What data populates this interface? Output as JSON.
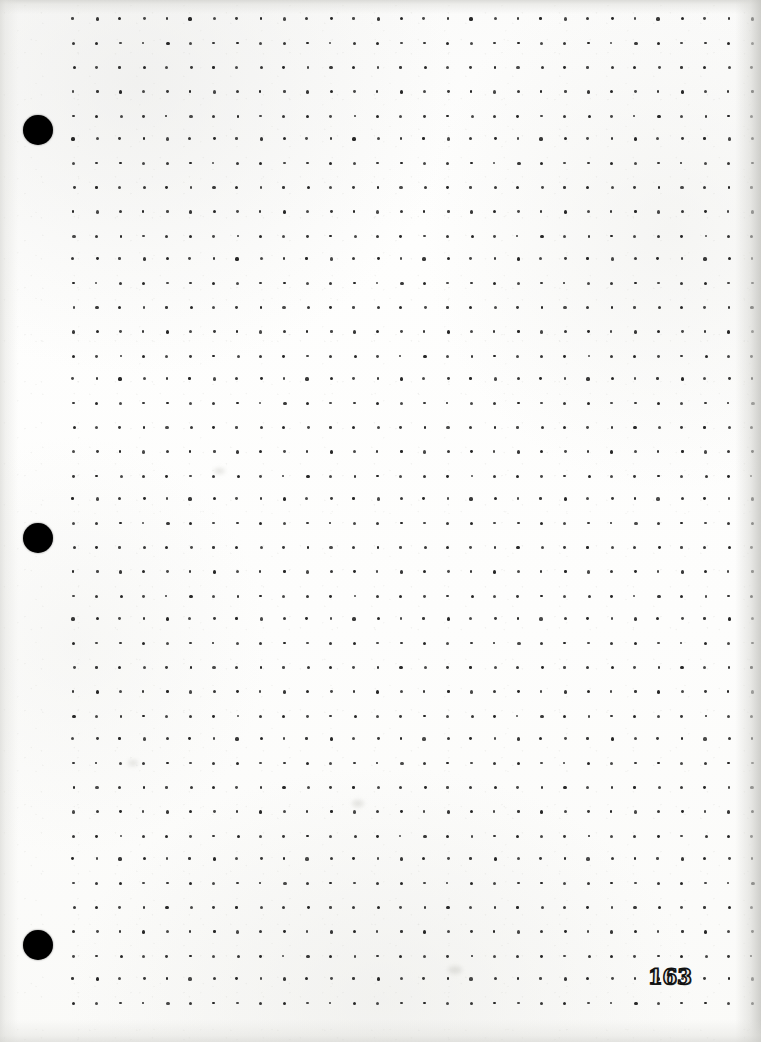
{
  "document": {
    "kind": "scanned-notebook-page",
    "description": "Blank dot-grid notebook page, three-hole punched, scanned",
    "page_number": "163",
    "paper_color": "#fdfdfc",
    "dot_color": "#1b1b1b",
    "hole_color": "#000000",
    "page_width": 761,
    "page_height": 1042
  },
  "grid": {
    "label": "dot-grid",
    "dot_diameter_px": 3,
    "spacing_x_px": 23.4,
    "spacing_y_px": 24.0,
    "origin_x_px": 72,
    "origin_y_px": 18,
    "columns": 30,
    "rows": 42
  },
  "holes": [
    {
      "label": "hole-punch-top",
      "cx": 38,
      "cy": 130,
      "r": 15
    },
    {
      "label": "hole-punch-middle",
      "cx": 38,
      "cy": 538,
      "r": 15
    },
    {
      "label": "hole-punch-bottom",
      "cx": 38,
      "cy": 945,
      "r": 15
    }
  ],
  "page_number_position": {
    "x": 648,
    "y": 966
  },
  "content": {
    "written_text": "",
    "notes": "Page is otherwise blank — no handwriting, rules, or printed text besides the page number."
  }
}
